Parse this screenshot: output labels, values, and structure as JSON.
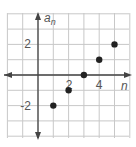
{
  "chart_data": {
    "type": "scatter",
    "title": "",
    "xlabel": "n",
    "ylabel": "a_n",
    "ylabel_main": "a",
    "ylabel_sub": "n",
    "x": [
      1,
      2,
      3,
      4,
      5
    ],
    "y": [
      -2,
      -1,
      0,
      1,
      2
    ],
    "xlim": [
      -2,
      6
    ],
    "ylim": [
      -4,
      4
    ],
    "x_tick_labels": [
      "2",
      "4"
    ],
    "y_tick_labels": [
      "2",
      "-2"
    ],
    "grid": true,
    "legend": null
  },
  "colors": {
    "grid": "#c8c8c8",
    "axis": "#444444",
    "point": "#222222",
    "label": "#555555"
  }
}
